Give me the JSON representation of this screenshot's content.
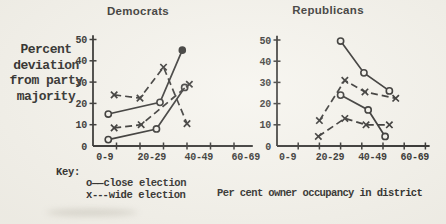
{
  "page": {
    "paper_color": "#f5f3ec",
    "ink_color": "#242321"
  },
  "y_axis_label": {
    "lines": [
      "Percent",
      "deviation",
      "from party",
      "majority"
    ]
  },
  "x_axis_caption": "Per cent owner occupancy in district",
  "key": {
    "heading": "Key:",
    "items": [
      {
        "symbol": "o",
        "connector": "——",
        "label": "close election",
        "marker": "circle",
        "line_style": "solid"
      },
      {
        "symbol": "x",
        "connector": "---",
        "label": "wide election",
        "marker": "x",
        "line_style": "dashed"
      }
    ]
  },
  "chart_data": [
    {
      "type": "line",
      "title": "Democrats",
      "xlabel": "Per cent owner occupancy in district",
      "ylabel": "Percent deviation from party majority",
      "xlim": [
        0,
        68
      ],
      "ylim": [
        0,
        52
      ],
      "grid": false,
      "x_ticks": [
        10,
        20,
        30,
        40,
        50,
        60
      ],
      "y_ticks": [
        0,
        10,
        20,
        30,
        40,
        50
      ],
      "x_tick_labels": [
        {
          "text": "0-9",
          "pos": 5
        },
        {
          "text": "20-29",
          "pos": 25
        },
        {
          "text": "40-49",
          "pos": 45
        },
        {
          "text": "60-69",
          "pos": 65
        }
      ],
      "series": [
        {
          "name": "close-election-upper",
          "legend": "close election",
          "marker": "circle",
          "line": "solid",
          "points": [
            [
              6.5,
              15
            ],
            [
              28.5,
              20.5
            ],
            [
              38,
              45
            ]
          ],
          "last_point_filled": true
        },
        {
          "name": "close-election-lower",
          "legend": "close election",
          "marker": "circle",
          "line": "solid",
          "points": [
            [
              6.5,
              3
            ],
            [
              27,
              8
            ],
            [
              39,
              27.5
            ]
          ]
        },
        {
          "name": "wide-election-upper",
          "legend": "wide election",
          "marker": "x",
          "line": "dashed",
          "points": [
            [
              9,
              24
            ],
            [
              20,
              22.5
            ],
            [
              30,
              37
            ],
            [
              40,
              10.5
            ]
          ]
        },
        {
          "name": "wide-election-lower",
          "legend": "wide election",
          "marker": "x",
          "line": "dashed",
          "points": [
            [
              9,
              8.5
            ],
            [
              20.5,
              10
            ],
            [
              41,
              29
            ]
          ]
        }
      ]
    },
    {
      "type": "line",
      "title": "Republicans",
      "xlabel": "Per cent owner occupancy in district",
      "ylabel": "Percent deviation from party majority",
      "xlim": [
        0,
        72
      ],
      "ylim": [
        0,
        52
      ],
      "grid": false,
      "x_ticks": [
        10,
        20,
        30,
        40,
        50,
        60,
        70
      ],
      "y_ticks": [
        0,
        10,
        20,
        30,
        40,
        50
      ],
      "x_tick_labels": [
        {
          "text": "0-9",
          "pos": 5
        },
        {
          "text": "20-29",
          "pos": 25
        },
        {
          "text": "40-49",
          "pos": 45
        },
        {
          "text": "60-69",
          "pos": 65
        }
      ],
      "series": [
        {
          "name": "close-election-upper",
          "legend": "close election",
          "marker": "circle",
          "line": "solid",
          "points": [
            [
              30,
              49.5
            ],
            [
              41,
              34.5
            ],
            [
              53,
              26
            ]
          ]
        },
        {
          "name": "close-election-lower",
          "legend": "close election",
          "marker": "circle",
          "line": "solid",
          "points": [
            [
              30,
              24
            ],
            [
              43,
              17
            ],
            [
              51,
              4.5
            ]
          ]
        },
        {
          "name": "wide-election-upper",
          "legend": "wide election",
          "marker": "x",
          "line": "dashed",
          "points": [
            [
              20,
              12
            ],
            [
              32,
              31
            ],
            [
              41.5,
              25.5
            ],
            [
              56,
              22.5
            ]
          ]
        },
        {
          "name": "wide-election-lower",
          "legend": "wide election",
          "marker": "x",
          "line": "dashed",
          "points": [
            [
              19.5,
              4.5
            ],
            [
              32,
              13
            ],
            [
              42,
              10
            ],
            [
              53,
              10
            ]
          ]
        }
      ]
    }
  ]
}
